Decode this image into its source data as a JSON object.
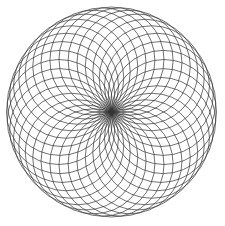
{
  "figure": {
    "type": "circle-rosette",
    "center": [
      111.5,
      112
    ],
    "outer_radius": 105,
    "circle_count": 36,
    "circle_radius": 52.5,
    "stroke_color": "#333333",
    "background": "#ffffff"
  }
}
